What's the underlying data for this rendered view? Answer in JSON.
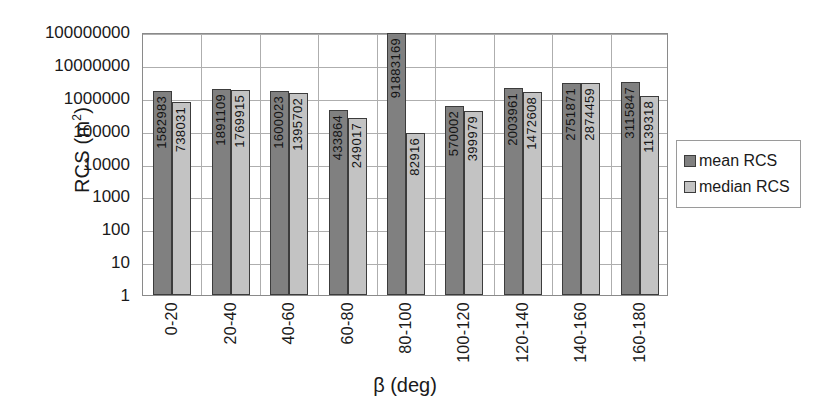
{
  "chart_data": {
    "type": "bar",
    "title": "",
    "xlabel": "β (deg)",
    "ylabel": "RCS (m²)",
    "yscale": "log",
    "ylim": [
      1,
      100000000
    ],
    "ytick_labels": [
      "1",
      "10",
      "100",
      "1000",
      "10000",
      "100000",
      "1000000",
      "10000000",
      "100000000"
    ],
    "ytick_values": [
      1,
      10,
      100,
      1000,
      10000,
      100000,
      1000000,
      10000000,
      100000000
    ],
    "grid": "horizontal-and-vertical",
    "legend_position": "right",
    "categories": [
      "0-20",
      "20-40",
      "40-60",
      "60-80",
      "80-100",
      "100-120",
      "120-140",
      "140-160",
      "160-180"
    ],
    "series": [
      {
        "name": "mean RCS",
        "color": "#808080",
        "values": [
          1582983,
          1891109,
          1600023,
          433864,
          91883169,
          570002,
          2003961,
          2751871,
          3115847
        ],
        "labels": [
          "1582983",
          "1891109",
          "1600023",
          "433864",
          "91883169",
          "570002",
          "2003961",
          "2751871",
          "3115847"
        ]
      },
      {
        "name": "median RCS",
        "color": "#c3c3c3",
        "values": [
          738031,
          1769915,
          1395702,
          249017,
          82916,
          399979,
          1472608,
          2874459,
          1139318
        ],
        "labels": [
          "738031",
          "1769915",
          "1395702",
          "249017",
          "82916",
          "399979",
          "1472608",
          "2874459",
          "1139318"
        ]
      }
    ]
  },
  "legend": {
    "items": [
      {
        "label": "mean RCS"
      },
      {
        "label": "median RCS"
      }
    ]
  },
  "axis": {
    "y_title_main": "RCS (m",
    "y_title_sup": "2",
    "y_title_tail": ")",
    "x_title": "β (deg)"
  }
}
